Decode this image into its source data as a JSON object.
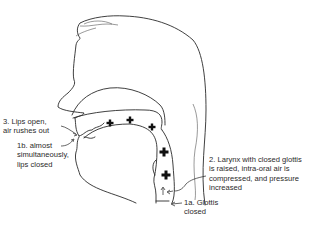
{
  "diagram": {
    "pressure_marker": "+",
    "pressure_marker_count": 5,
    "colors": {
      "line": "#2a2a2a",
      "text": "#2a2a2a",
      "background": "#ffffff"
    }
  },
  "labels": {
    "lips_open": {
      "lines": [
        "3. Lips open,",
        "air rushes out"
      ]
    },
    "lips_closed": {
      "lines": [
        "1b. almost",
        "simultaneously,",
        "lips closed"
      ]
    },
    "larynx": {
      "lines": [
        "2. Larynx with closed glottis",
        "is raised, intra-oral air is",
        "compressed, and pressure",
        "increased"
      ]
    },
    "glottis": {
      "lines": [
        "1a. Glottis",
        "closed"
      ]
    }
  }
}
